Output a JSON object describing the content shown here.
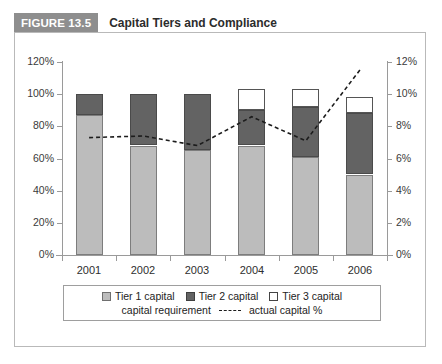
{
  "figure": {
    "badge": "FIGURE 13.5",
    "title": "Capital Tiers and Compliance"
  },
  "legend": {
    "tier1_label": "Tier 1 capital",
    "tier2_label": "Tier 2 capital",
    "tier3_label": "Tier 3 capital",
    "requirement_label": "capital requirement",
    "actual_label": "actual capital %"
  },
  "colors": {
    "tier1": "#bcbcbc",
    "tier2": "#636363",
    "tier3": "#ffffff",
    "line": "#1c1c1c",
    "badge_bg": "#8e8e8e",
    "axis": "#9a9a9a"
  },
  "chart_data": {
    "type": "bar",
    "title": "Capital Tiers and Compliance",
    "xlabel": "",
    "ylabel": "",
    "stacked": true,
    "grid": false,
    "legend_position": "bottom",
    "categories": [
      "2001",
      "2002",
      "2003",
      "2004",
      "2005",
      "2006"
    ],
    "series": [
      {
        "name": "Tier 1 capital",
        "axis": "left",
        "type": "bar",
        "values": [
          87,
          68,
          65,
          68,
          61,
          50
        ]
      },
      {
        "name": "Tier 2 capital",
        "axis": "left",
        "type": "bar",
        "values": [
          13,
          32,
          35,
          22,
          31,
          38
        ]
      },
      {
        "name": "Tier 3 capital",
        "axis": "left",
        "type": "bar",
        "values": [
          0,
          0,
          0,
          13,
          11,
          10
        ]
      },
      {
        "name": "actual capital %",
        "axis": "right",
        "type": "line",
        "style": "dashed",
        "values": [
          7.3,
          7.4,
          6.8,
          8.6,
          7.1,
          11.5
        ]
      }
    ],
    "left_axis": {
      "ticks": [
        "0%",
        "20%",
        "40%",
        "60%",
        "80%",
        "100%",
        "120%"
      ],
      "tick_values": [
        0,
        20,
        40,
        60,
        80,
        100,
        120
      ],
      "ylim": [
        0,
        120
      ]
    },
    "right_axis": {
      "ticks": [
        "0%",
        "2%",
        "4%",
        "6%",
        "8%",
        "10%",
        "12%"
      ],
      "tick_values": [
        0,
        2,
        4,
        6,
        8,
        10,
        12
      ],
      "ylim": [
        0,
        12
      ]
    }
  }
}
